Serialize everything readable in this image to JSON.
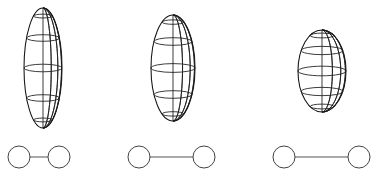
{
  "figure": {
    "background_color": "#ffffff",
    "stroke_color": "#1a1a1a",
    "node_stroke_color": "#444444",
    "bond_stroke_color": "#555555",
    "canvas": {
      "width": 381,
      "height": 176
    },
    "panel_count": 3
  },
  "panels": [
    {
      "id": "panel-1",
      "label": "leftmost",
      "spheroid": {
        "name": "prolate-spheroid-elongated",
        "center_x": 43,
        "center_y": 68,
        "semi_axis_a": 19,
        "semi_axis_c": 60,
        "aspect_ratio": 3.16,
        "meridian_count": 7,
        "latitude_count": 5,
        "shape": "prolate"
      },
      "dumbbell": {
        "name": "two-site-dumbbell-short",
        "node_radius": 11,
        "center_y": 157,
        "left_node_x": 19,
        "right_node_x": 59,
        "bond_length": 40,
        "node_count": 2
      }
    },
    {
      "id": "panel-2",
      "label": "middle",
      "spheroid": {
        "name": "prolate-spheroid-intermediate",
        "center_x": 173,
        "center_y": 68,
        "semi_axis_a": 22,
        "semi_axis_c": 53,
        "aspect_ratio": 2.41,
        "meridian_count": 7,
        "latitude_count": 5,
        "shape": "prolate"
      },
      "dumbbell": {
        "name": "two-site-dumbbell-medium",
        "node_radius": 11,
        "center_y": 157,
        "left_node_x": 139,
        "right_node_x": 204,
        "bond_length": 65,
        "node_count": 2
      }
    },
    {
      "id": "panel-3",
      "label": "rightmost",
      "spheroid": {
        "name": "prolate-spheroid-compact",
        "center_x": 322,
        "center_y": 71,
        "semi_axis_a": 24,
        "semi_axis_c": 41,
        "aspect_ratio": 1.71,
        "meridian_count": 7,
        "latitude_count": 5,
        "shape": "prolate"
      },
      "dumbbell": {
        "name": "two-site-dumbbell-long",
        "node_radius": 11,
        "center_y": 157,
        "left_node_x": 284,
        "right_node_x": 359,
        "bond_length": 75,
        "node_count": 2
      }
    }
  ]
}
